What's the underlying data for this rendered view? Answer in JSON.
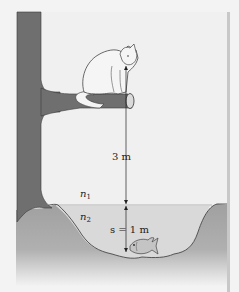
{
  "figure": {
    "labels": {
      "height_above": "3 m",
      "medium_1": "n",
      "medium_1_sub": "1",
      "medium_2": "n",
      "medium_2_sub": "2",
      "depth_prefix": "s = 1 m"
    },
    "objects": [
      "tree",
      "branch",
      "cat",
      "water",
      "fish",
      "distance-arrow"
    ],
    "colors": {
      "background": "#f3f3f3",
      "tree": "#6f6f6f",
      "ground": "#a3a3a3",
      "water": "#dcdcdc",
      "cat": "#f5f5f5",
      "fish": "#bdbdbd",
      "outline": "#333333",
      "right_border": "#c8c8c8"
    }
  }
}
